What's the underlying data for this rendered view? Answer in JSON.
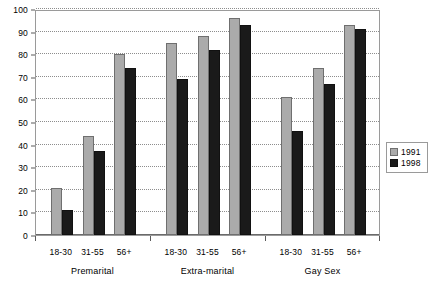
{
  "chart_data": {
    "type": "bar",
    "title": "",
    "subtitle": "",
    "xlabel": "",
    "ylabel": "",
    "ylim": [
      0,
      100
    ],
    "ytick_step": 10,
    "yticks": [
      0,
      10,
      20,
      30,
      40,
      50,
      60,
      70,
      80,
      90,
      100
    ],
    "grid": true,
    "legend_position": "right",
    "groups": [
      {
        "name": "Premarital",
        "categories": [
          "18-30",
          "31-55",
          "56+"
        ]
      },
      {
        "name": "Extra-marital",
        "categories": [
          "18-30",
          "31-55",
          "56+"
        ]
      },
      {
        "name": "Gay Sex",
        "categories": [
          "18-30",
          "31-55",
          "56+"
        ]
      }
    ],
    "categories": [
      "Premarital 18-30",
      "Premarital 31-55",
      "Premarital 56+",
      "Extra-marital 18-30",
      "Extra-marital 31-55",
      "Extra-marital 56+",
      "Gay Sex 18-30",
      "Gay Sex 31-55",
      "Gay Sex 56+"
    ],
    "series": [
      {
        "name": "1991",
        "color": "#ababab",
        "values": [
          21,
          44,
          80,
          85,
          88,
          96,
          61,
          74,
          93
        ]
      },
      {
        "name": "1998",
        "color": "#1a1a1a",
        "values": [
          11,
          37,
          74,
          69,
          82,
          93,
          46,
          67,
          91
        ]
      }
    ]
  },
  "legend": {
    "items": [
      {
        "label": "1991",
        "color": "#ababab"
      },
      {
        "label": "1998",
        "color": "#1a1a1a"
      }
    ]
  },
  "axis": {
    "y_labels": [
      "100",
      "90",
      "80",
      "70",
      "60",
      "50",
      "40",
      "30",
      "20",
      "10",
      "0"
    ]
  },
  "x_labels": {
    "categories": [
      "18-30",
      "31-55",
      "56+",
      "18-30",
      "31-55",
      "56+",
      "18-30",
      "31-55",
      "56+"
    ],
    "groups": [
      "Premarital",
      "Extra-marital",
      "Gay Sex"
    ]
  }
}
